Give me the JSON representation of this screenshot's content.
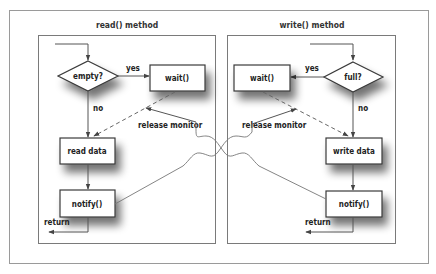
{
  "diagram": {
    "read_panel": {
      "title": "read() method",
      "decision": "empty?",
      "yes_label": "yes",
      "no_label": "no",
      "wait_box": "wait()",
      "action_box": "read data",
      "notify_box": "notify()",
      "return_label": "return",
      "release_label": "release monitor"
    },
    "write_panel": {
      "title": "write() method",
      "decision": "full?",
      "yes_label": "yes",
      "no_label": "no",
      "wait_box": "wait()",
      "action_box": "write data",
      "notify_box": "notify()",
      "return_label": "return",
      "release_label": "release monitor"
    }
  }
}
